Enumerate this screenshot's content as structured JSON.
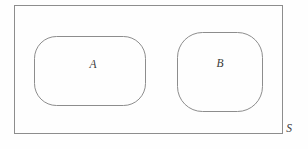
{
  "figure": {
    "kind": "venn-set-diagram",
    "background_color": "#fefefe",
    "stroke_color": "#8d8d8d",
    "label_color": "#3a3a3a",
    "width": 308,
    "height": 149
  },
  "universe": {
    "label": "S",
    "label_x": 289,
    "label_y": 129,
    "x": 14.5,
    "y": 5.5,
    "width": 268,
    "height": 128
  },
  "sets": [
    {
      "label": "A",
      "label_x": 93,
      "label_y": 65,
      "x": 34.5,
      "y": 36.5,
      "width": 111,
      "height": 69,
      "radius": 22
    },
    {
      "label": "B",
      "label_x": 220,
      "label_y": 64,
      "x": 177.5,
      "y": 32.5,
      "width": 85,
      "height": 79,
      "radius": 25
    }
  ]
}
